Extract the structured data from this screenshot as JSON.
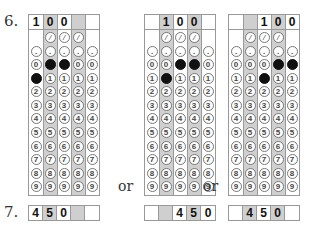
{
  "question6": {
    "number": "6.",
    "separator": "or",
    "grids": [
      {
        "x": 28,
        "header": [
          "1",
          "0",
          "0",
          "",
          ""
        ],
        "shaded_cols": [
          1,
          3
        ],
        "filled": {
          "0": [
            1,
            2
          ],
          "1": [
            0
          ]
        }
      },
      {
        "x": 144,
        "header": [
          "",
          "1",
          "0",
          "0",
          ""
        ],
        "shaded_cols": [
          1,
          3
        ],
        "filled": {
          "0": [
            2,
            3
          ],
          "1": [
            1
          ]
        }
      },
      {
        "x": 228,
        "header": [
          "",
          "",
          "1",
          "0",
          "0"
        ],
        "shaded_cols": [
          1,
          3
        ],
        "filled": {
          "0": [
            3,
            4
          ],
          "1": [
            2
          ]
        }
      }
    ],
    "slash_cols": [
      1,
      2,
      3
    ],
    "row_labels": {
      "slash": "/",
      "dot": ".",
      "digits": [
        "0",
        "1",
        "2",
        "3",
        "4",
        "5",
        "6",
        "7",
        "8",
        "9"
      ]
    }
  },
  "question7": {
    "number": "7.",
    "answers": [
      {
        "x": 28,
        "cells": [
          "4",
          "5",
          "0",
          "",
          ""
        ],
        "shaded_cols": [
          1,
          3
        ]
      },
      {
        "x": 144,
        "cells": [
          "",
          "",
          "4",
          "5",
          "0"
        ],
        "shaded_cols": [
          1,
          3
        ]
      },
      {
        "x": 228,
        "cells": [
          "",
          "4",
          "5",
          "0",
          ""
        ],
        "shaded_cols": [
          1,
          3
        ]
      }
    ]
  }
}
